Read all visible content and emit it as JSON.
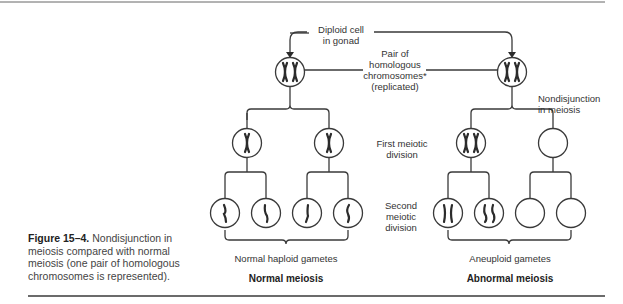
{
  "figure": {
    "caption_title": "Figure 15–4.",
    "caption_text": "Nondisjunction in meiosis compared with normal meiosis (one pair of homologous chromosomes is represented)."
  },
  "labels": {
    "diploid_line1": "Diploid cell",
    "diploid_line2": "in gonad",
    "pair_line1": "Pair of",
    "pair_line2": "homologous",
    "pair_line3": "chromosomes*",
    "pair_line4": "(replicated)",
    "nondisjunction_line1": "Nondisjunction",
    "nondisjunction_line2": "in meiosis",
    "first_div_line1": "First meiotic",
    "first_div_line2": "division",
    "second_div_line1": "Second",
    "second_div_line2": "meiotic",
    "second_div_line3": "division",
    "normal_gametes": "Normal haploid gametes",
    "aneuploid_gametes": "Aneuploid gametes"
  },
  "headings": {
    "normal": "Normal meiosis",
    "abnormal": "Abnormal meiosis"
  },
  "colors": {
    "line": "#3a3a3a",
    "chromosome": "#2b2b2b",
    "text": "#333333"
  }
}
